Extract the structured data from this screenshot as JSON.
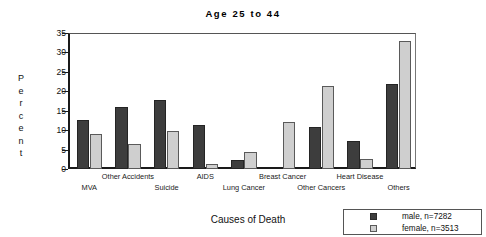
{
  "chart_data": {
    "type": "bar",
    "title": "Age 25 to 44",
    "xlabel": "Causes of Death",
    "ylabel": "Percent",
    "ylim": [
      0,
      35
    ],
    "yticks": [
      0,
      5,
      10,
      15,
      20,
      25,
      30,
      35
    ],
    "grid": false,
    "legend_position": "bottom-right",
    "categories": [
      "MVA",
      "Other Accidents",
      "Suicide",
      "AIDS",
      "Lung Cancer",
      "Breast Cancer",
      "Other Cancers",
      "Heart Disease",
      "Others"
    ],
    "series": [
      {
        "name": "male, n=7282",
        "color": "#3d3d3d",
        "values": [
          12.7,
          16.0,
          17.8,
          11.2,
          2.2,
          0,
          10.9,
          7.1,
          22.0
        ]
      },
      {
        "name": "female, n=3513",
        "color": "#cfcfcf",
        "values": [
          9.1,
          6.5,
          9.8,
          1.2,
          4.5,
          12.2,
          21.3,
          2.7,
          33.0
        ]
      }
    ]
  },
  "ylabel_letters": [
    "P",
    "e",
    "r",
    "c",
    "e",
    "n",
    "t"
  ],
  "legend": {
    "items": [
      {
        "label": "male, n=7282",
        "swatch": "male"
      },
      {
        "label": "female, n=3513",
        "swatch": "female"
      }
    ]
  }
}
